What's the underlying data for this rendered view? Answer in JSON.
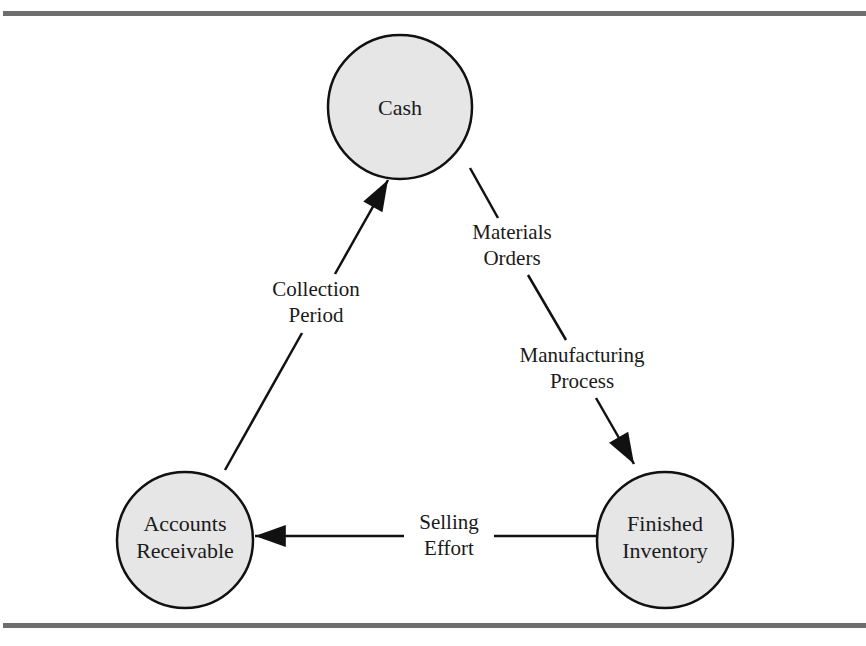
{
  "diagram": {
    "type": "cycle",
    "nodes": [
      {
        "id": "cash",
        "label_lines": [
          "Cash"
        ],
        "fill": "#e6e6e6"
      },
      {
        "id": "finished_inventory",
        "label_lines": [
          "Finished",
          "Inventory"
        ],
        "fill": "#e6e6e6"
      },
      {
        "id": "accounts_receivable",
        "label_lines": [
          "Accounts",
          "Receivable"
        ],
        "fill": "#e6e6e6"
      }
    ],
    "edges": [
      {
        "from": "cash",
        "to": "finished_inventory",
        "labels": [
          {
            "lines": [
              "Materials",
              "Orders"
            ]
          },
          {
            "lines": [
              "Manufacturing",
              "Process"
            ]
          }
        ]
      },
      {
        "from": "finished_inventory",
        "to": "accounts_receivable",
        "labels": [
          {
            "lines": [
              "Selling",
              "Effort"
            ]
          }
        ]
      },
      {
        "from": "accounts_receivable",
        "to": "cash",
        "labels": [
          {
            "lines": [
              "Collection",
              "Period"
            ]
          }
        ]
      }
    ],
    "colors": {
      "rule": "#6e6e6e",
      "stroke": "#111111",
      "node_fill": "#e6e6e6"
    }
  }
}
